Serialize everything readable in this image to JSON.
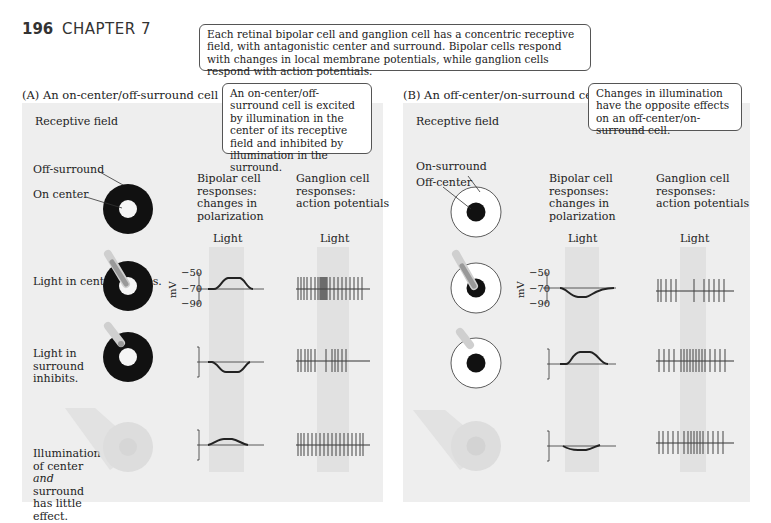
{
  "header": {
    "page_number": "196",
    "chapter": "CHAPTER 7"
  },
  "top_callout": "Each retinal bipolar cell and ganglion cell has a concentric receptive field, with antagonistic center and surround. Bipolar cells respond with changes in local membrane potentials, while ganglion cells respond with action potentials.",
  "panel_a": {
    "title": "(A)  An on-center/off-surround cell",
    "callout": "An on-center/off-surround cell is excited by illumination in the center of its receptive field and inhibited by illumination in the surround.",
    "receptive_field_label": "Receptive field",
    "off_surround_label": "Off-surround",
    "on_center_label": "On center",
    "bipolar_header": "Bipolar cell responses: changes in polarization",
    "ganglion_header": "Ganglion cell responses: action potentials",
    "light_label_bipolar": "Light",
    "light_label_ganglion": "Light",
    "rows": [
      {
        "label": "Light in center excites."
      },
      {
        "label": "Light in surround inhibits."
      },
      {
        "label_pre": "Illumination of center ",
        "label_em": "and",
        "label_post": " surround has little effect."
      }
    ],
    "axis": {
      "unit": "mV",
      "ticks": [
        "−50",
        "−70",
        "−90"
      ]
    }
  },
  "panel_b": {
    "title": "(B)  An off-center/on-surround cell",
    "callout": "Changes in illumination have the opposite effects on an off-center/on-surround cell.",
    "receptive_field_label": "Receptive field",
    "on_surround_label": "On-surround",
    "off_center_label": "Off-center",
    "bipolar_header": "Bipolar cell responses: changes in polarization",
    "ganglion_header": "Ganglion cell responses: action potentials",
    "light_label_bipolar": "Light",
    "light_label_ganglion": "Light",
    "axis": {
      "unit": "mV",
      "ticks": [
        "−50",
        "−70",
        "−90"
      ]
    }
  },
  "colors": {
    "panel_bg": "#eeeeee",
    "light_band": "#d8d8d8",
    "ink": "#222222"
  }
}
